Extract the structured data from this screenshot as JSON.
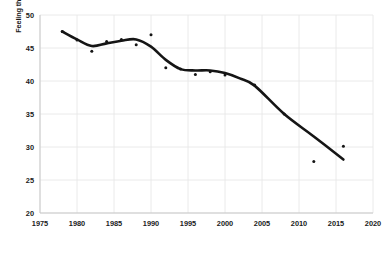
{
  "chart_data": {
    "type": "line",
    "title": "",
    "subtitle": "",
    "xlabel": "",
    "ylabel": "Feeling thermometer score for opposing party",
    "xlim": [
      1975,
      2020
    ],
    "ylim": [
      20,
      50
    ],
    "xticks": [
      "1975",
      "1980",
      "1985",
      "1990",
      "1995",
      "2000",
      "2005",
      "2010",
      "2015",
      "2020"
    ],
    "yticks": [
      "50",
      "45",
      "40",
      "35",
      "30",
      "25",
      "20"
    ],
    "grid": true,
    "legend": "none",
    "line_color": "#151515",
    "marker_color": "#151515",
    "grid_color": "#e8e8e8",
    "series": [
      {
        "name": "Smoothed trend",
        "type": "line",
        "x": [
          1978,
          1980,
          1982,
          1984,
          1986,
          1988,
          1990,
          1992,
          1994,
          1996,
          1998,
          2000,
          2002,
          2004,
          2008,
          2012,
          2016
        ],
        "values": [
          47.5,
          46.3,
          45.3,
          45.7,
          46.1,
          46.3,
          45.2,
          43.2,
          41.8,
          41.6,
          41.6,
          41.2,
          40.4,
          39.3,
          35.0,
          31.6,
          28.1
        ]
      },
      {
        "name": "Observed data points",
        "type": "scatter",
        "x": [
          1978,
          1980,
          1982,
          1984,
          1986,
          1988,
          1990,
          1992,
          1994,
          1996,
          1998,
          2000,
          2004,
          2008,
          2012,
          2016
        ],
        "values": [
          47.5,
          46.2,
          44.5,
          46.0,
          46.3,
          45.5,
          47.0,
          42.0,
          41.8,
          41.0,
          41.4,
          40.9,
          39.4,
          35.0,
          27.8,
          30.1
        ]
      }
    ]
  }
}
